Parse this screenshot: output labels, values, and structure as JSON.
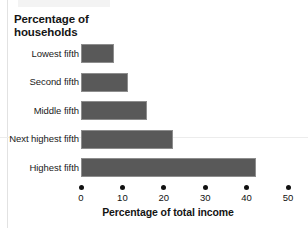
{
  "figure": {
    "y_axis_title_line1": "Percentage of",
    "y_axis_title_line2": "households",
    "x_axis_title": "Percentage of total income"
  },
  "chart_data": {
    "type": "bar",
    "orientation": "horizontal",
    "title": "",
    "xlabel": "Percentage of total income",
    "ylabel": "Percentage of households",
    "categories": [
      "Lowest fifth",
      "Second fifth",
      "Middle fifth",
      "Next highest fifth",
      "Highest fifth"
    ],
    "values": [
      8,
      11.4,
      16,
      22.3,
      42.3
    ],
    "xlim": [
      0,
      50
    ],
    "xticks": [
      0,
      10,
      20,
      30,
      40,
      50
    ],
    "xtick_labels": [
      "0",
      "10",
      "20",
      "30",
      "40",
      "50"
    ],
    "grid": false,
    "legend": false,
    "bar_color": "#595959",
    "bar_edge_color": "#8d8d8d",
    "tick_marker": "filled-circle"
  }
}
